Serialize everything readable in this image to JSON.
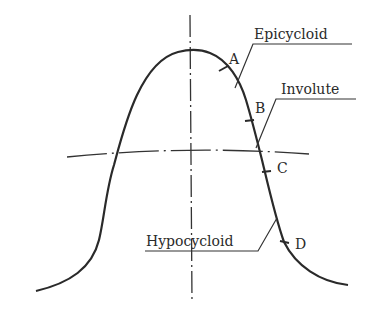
{
  "diagram": {
    "labels": {
      "epicycloid": "Epicycloid",
      "involute": "Involute",
      "hypocycloid": "Hypocycloid"
    },
    "points": {
      "A": "A",
      "B": "B",
      "C": "C",
      "D": "D"
    },
    "colors": {
      "line": "#2a2a2a",
      "background": "#ffffff"
    }
  }
}
